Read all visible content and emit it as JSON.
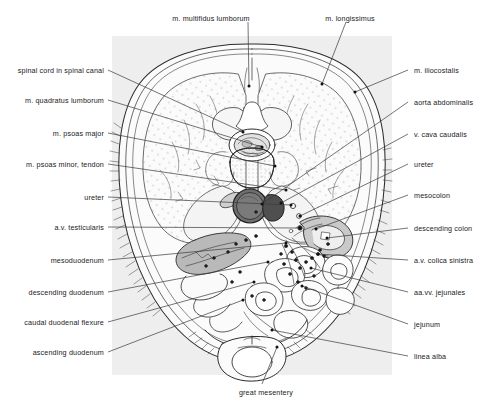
{
  "figure": {
    "panel": {
      "background_color": "#eeeeee",
      "x": 112,
      "y": 36,
      "width": 280,
      "height": 339
    },
    "ink_color": "#2b2b2b",
    "leader_color": "#3a3a3a"
  },
  "labels": {
    "top": [
      {
        "id": "m-multifidus-lumborum",
        "text": "m. multifidus lumborum",
        "x": 166,
        "y": 14,
        "align": "center",
        "anchor_x": 248,
        "anchor_y": 22,
        "target_x": 249,
        "target_y": 86
      },
      {
        "id": "m-longissimus",
        "text": "m. longissimus",
        "x": 305,
        "y": 14,
        "align": "center",
        "anchor_x": 346,
        "anchor_y": 22,
        "target_x": 322,
        "target_y": 84
      }
    ],
    "left": [
      {
        "id": "spinal-cord-in-spinal-canal",
        "text": "spinal cord in spinal canal",
        "x": 8,
        "y": 66,
        "target_x": 243,
        "target_y": 132
      },
      {
        "id": "m-quadratus-lumborum",
        "text": "m. quadratus lumborum",
        "x": 8,
        "y": 96,
        "target_x": 262,
        "target_y": 147
      },
      {
        "id": "m-psoas-major",
        "text": "m. psoas major",
        "x": 8,
        "y": 129,
        "target_x": 275,
        "target_y": 166
      },
      {
        "id": "m-psoas-minor-tendon",
        "text": "m. psoas minor, tendon",
        "x": 8,
        "y": 160,
        "target_x": 286,
        "target_y": 190
      },
      {
        "id": "ureter-left",
        "text": "ureter",
        "x": 8,
        "y": 193,
        "target_x": 291,
        "target_y": 205
      },
      {
        "id": "av-testicularis",
        "text": "a.v. testicularis",
        "x": 8,
        "y": 223,
        "target_x": 300,
        "target_y": 228
      },
      {
        "id": "mesoduodenum",
        "text": "mesoduodenum",
        "x": 8,
        "y": 256,
        "target_x": 286,
        "target_y": 243
      },
      {
        "id": "descending-duodenum",
        "text": "descending duodenum",
        "x": 8,
        "y": 288,
        "target_x": 268,
        "target_y": 262
      },
      {
        "id": "caudal-duodenal-flexure",
        "text": "caudal duodenal flexure",
        "x": 8,
        "y": 318,
        "target_x": 254,
        "target_y": 282
      },
      {
        "id": "ascending-duodenum",
        "text": "ascending duodenum",
        "x": 8,
        "y": 348,
        "target_x": 243,
        "target_y": 300
      }
    ],
    "right": [
      {
        "id": "m-iliocostalis",
        "text": "m. iliocostalis",
        "x": 414,
        "y": 66,
        "target_x": 355,
        "target_y": 92
      },
      {
        "id": "aorta-abdominalis",
        "text": "aorta abdominalis",
        "x": 414,
        "y": 98,
        "target_x": 262,
        "target_y": 204
      },
      {
        "id": "v-cava-caudalis",
        "text": "v. cava caudalis",
        "x": 414,
        "y": 130,
        "target_x": 281,
        "target_y": 203
      },
      {
        "id": "ureter-right",
        "text": "ureter",
        "x": 414,
        "y": 160,
        "target_x": 300,
        "target_y": 216
      },
      {
        "id": "mesocolon",
        "text": "mesocolon",
        "x": 414,
        "y": 191,
        "target_x": 316,
        "target_y": 229
      },
      {
        "id": "descending-colon",
        "text": "descending colon",
        "x": 414,
        "y": 224,
        "target_x": 327,
        "target_y": 238
      },
      {
        "id": "av-colica-sinistra",
        "text": "a.v. colica sinistra",
        "x": 414,
        "y": 256,
        "target_x": 318,
        "target_y": 254
      },
      {
        "id": "aa-vv-jejunales",
        "text": "aa.vv. jejunales",
        "x": 414,
        "y": 288,
        "target_x": 311,
        "target_y": 268
      },
      {
        "id": "jejunum",
        "text": "jejunum",
        "x": 414,
        "y": 320,
        "target_x": 302,
        "target_y": 286
      },
      {
        "id": "linea-alba",
        "text": "linea alba",
        "x": 414,
        "y": 352,
        "target_x": 272,
        "target_y": 330
      }
    ],
    "bottom": [
      {
        "id": "great-mesentery",
        "text": "great mesentery",
        "x": 221,
        "y": 388,
        "align": "center",
        "anchor_x": 262,
        "anchor_y": 384,
        "target_x": 277,
        "target_y": 347
      }
    ]
  }
}
